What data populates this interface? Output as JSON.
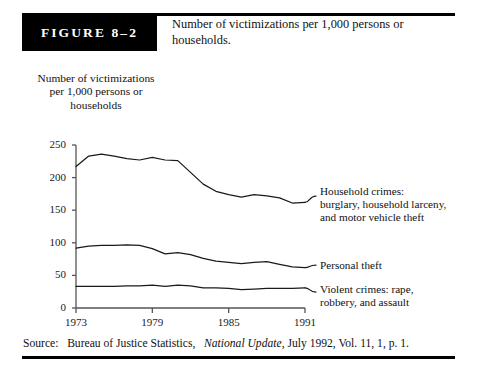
{
  "figure": {
    "badge_label": "FIGURE 8–2",
    "caption": "Number of victimizations per 1,000 persons or households."
  },
  "axis_title": "Number of victimizations per 1,000 persons or households",
  "source": {
    "prefix": "Source:",
    "publisher": "Bureau of Justice Statistics,",
    "publication": "National Update",
    "details": ", July 1992, Vol. 11, 1, p. 1."
  },
  "annotations": {
    "household": "Household crimes: burglary, household larceny, and motor vehicle theft",
    "household_lines": [
      "Household crimes:",
      "burglary, household larceny,",
      "and motor vehicle theft"
    ],
    "personal": "Personal theft",
    "personal_lines": [
      "Personal theft"
    ],
    "violent": "Violent crimes: rape, robbery, and assault",
    "violent_lines": [
      "Violent crimes: rape,",
      "robbery, and assault"
    ]
  },
  "chart_data": {
    "type": "line",
    "title": "Number of victimizations per 1,000 persons or households",
    "xlabel": "",
    "ylabel": "Number of victimizations per 1,000 persons or households",
    "xlim": [
      1973,
      1991
    ],
    "ylim": [
      0,
      250
    ],
    "yticks": [
      0,
      50,
      100,
      150,
      200,
      250
    ],
    "xticks": [
      1973,
      1979,
      1985,
      1991
    ],
    "grid": false,
    "legend": "inline-right-annotations",
    "x": [
      1973,
      1974,
      1975,
      1976,
      1977,
      1978,
      1979,
      1980,
      1981,
      1982,
      1983,
      1984,
      1985,
      1986,
      1987,
      1988,
      1989,
      1990,
      1991
    ],
    "series": [
      {
        "name": "Household crimes: burglary, household larceny, and motor vehicle theft",
        "values": [
          217,
          233,
          236,
          233,
          229,
          227,
          231,
          227,
          226,
          208,
          190,
          179,
          174,
          170,
          174,
          172,
          169,
          161,
          162
        ],
        "color": "#1a1a1a"
      },
      {
        "name": "Personal theft",
        "values": [
          92,
          95,
          96,
          96,
          97,
          96,
          91,
          83,
          85,
          82,
          76,
          72,
          70,
          68,
          70,
          71,
          67,
          63,
          62
        ],
        "color": "#1a1a1a"
      },
      {
        "name": "Violent crimes: rape, robbery, and assault",
        "values": [
          33,
          33,
          33,
          33,
          34,
          34,
          35,
          33,
          35,
          34,
          31,
          31,
          30,
          28,
          29,
          30,
          30,
          30,
          31
        ],
        "color": "#1a1a1a"
      }
    ]
  },
  "colors": {
    "ink": "#111111",
    "rule": "#000000",
    "badge_bg": "#000000",
    "badge_fg": "#ffffff",
    "axis": "#555555",
    "line": "#1a1a1a"
  }
}
